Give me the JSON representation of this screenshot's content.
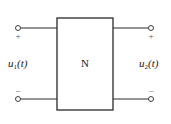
{
  "diagram": {
    "type": "two-port-network",
    "block": {
      "label": "N"
    },
    "input_port": {
      "voltage_var": "u",
      "voltage_sub": "1",
      "voltage_arg": "(t)",
      "plus_sign": "+",
      "minus_sign": "−"
    },
    "output_port": {
      "voltage_var": "u",
      "voltage_sub": "2",
      "voltage_arg": "(t)",
      "plus_sign": "+",
      "minus_sign": "−"
    },
    "colors": {
      "line": "#2a2a2a",
      "background": "#ffffff"
    }
  }
}
